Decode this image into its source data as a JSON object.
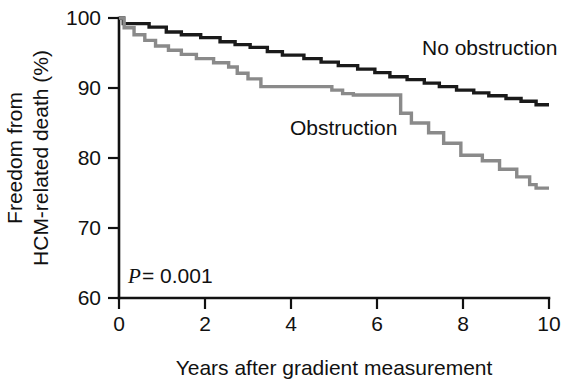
{
  "chart_data": {
    "type": "line",
    "title": "",
    "subtitle": "",
    "xlabel": "Years after gradient measurement",
    "ylabel": "Freedom from HCM-related death (%)",
    "ylabel_line1": "Freedom from",
    "ylabel_line2": "HCM-related death (%)",
    "xlim": [
      0,
      10
    ],
    "ylim": [
      60,
      100
    ],
    "xticks": [
      0,
      2,
      4,
      6,
      8,
      10
    ],
    "xtick_labels": [
      "0",
      "2",
      "4",
      "6",
      "8",
      "10"
    ],
    "yticks": [
      60,
      70,
      80,
      90,
      100
    ],
    "ytick_labels": [
      "60",
      "70",
      "80",
      "90",
      "100"
    ],
    "grid": false,
    "legend_position": "inline-annotation",
    "annotations": [
      {
        "name": "p-value",
        "text_italic": "P",
        "text": " = 0.001",
        "x": 0.25,
        "y": 63.5
      }
    ],
    "series": [
      {
        "name": "No obstruction",
        "color": "#1a1a1a",
        "label_x": 7.1,
        "label_y": 93.2,
        "step": "post",
        "x": [
          0.0,
          0.1,
          0.1,
          0.7,
          0.7,
          1.1,
          1.1,
          1.45,
          1.45,
          1.9,
          1.9,
          2.35,
          2.35,
          2.7,
          2.7,
          3.05,
          3.05,
          3.45,
          3.45,
          3.8,
          3.8,
          4.3,
          4.3,
          4.7,
          4.7,
          5.1,
          5.1,
          5.55,
          5.55,
          5.95,
          5.95,
          6.3,
          6.3,
          6.7,
          6.7,
          7.1,
          7.1,
          7.45,
          7.45,
          7.85,
          7.85,
          8.25,
          8.25,
          8.6,
          8.6,
          9.0,
          9.0,
          9.35,
          9.35,
          9.7,
          9.7,
          10.0
        ],
        "y": [
          100.0,
          100.0,
          99.2,
          99.2,
          98.7,
          98.7,
          98.0,
          98.0,
          97.6,
          97.6,
          97.2,
          97.2,
          96.6,
          96.6,
          96.2,
          96.2,
          95.8,
          95.8,
          95.2,
          95.2,
          94.7,
          94.7,
          94.2,
          94.2,
          93.7,
          93.7,
          93.2,
          93.2,
          92.7,
          92.7,
          92.2,
          92.2,
          91.6,
          91.6,
          91.2,
          91.2,
          90.7,
          90.7,
          90.2,
          90.2,
          89.7,
          89.7,
          89.3,
          89.3,
          88.9,
          88.9,
          88.5,
          88.5,
          88.1,
          88.1,
          87.6,
          87.6
        ]
      },
      {
        "name": "Obstruction",
        "color": "#8a8a8a",
        "label_x": 4.0,
        "label_y": 85.5,
        "step": "post",
        "x": [
          0.0,
          0.12,
          0.12,
          0.35,
          0.35,
          0.6,
          0.6,
          0.85,
          0.85,
          1.15,
          1.15,
          1.45,
          1.45,
          1.8,
          1.8,
          2.2,
          2.2,
          2.55,
          2.55,
          2.75,
          2.75,
          3.0,
          3.0,
          3.3,
          3.3,
          4.95,
          4.95,
          5.2,
          5.2,
          5.45,
          5.45,
          6.55,
          6.55,
          6.8,
          6.8,
          7.2,
          7.2,
          7.55,
          7.55,
          7.95,
          7.95,
          8.45,
          8.45,
          8.85,
          8.85,
          9.25,
          9.25,
          9.55,
          9.55,
          9.7,
          9.7,
          10.0
        ],
        "y": [
          100.0,
          100.0,
          98.6,
          98.6,
          97.6,
          97.6,
          96.8,
          96.8,
          96.0,
          96.0,
          95.4,
          95.4,
          94.8,
          94.8,
          94.2,
          94.2,
          93.6,
          93.6,
          93.0,
          93.0,
          92.1,
          92.1,
          91.3,
          91.3,
          90.2,
          90.2,
          89.7,
          89.7,
          89.2,
          89.2,
          89.0,
          89.0,
          86.4,
          86.4,
          85.0,
          85.0,
          83.6,
          83.6,
          82.1,
          82.1,
          80.4,
          80.4,
          79.6,
          79.6,
          78.4,
          78.4,
          77.3,
          77.3,
          76.2,
          76.2,
          75.7,
          75.7
        ]
      }
    ]
  },
  "axes": {
    "x_axis_name": "x-axis",
    "y_axis_name": "y-axis"
  }
}
